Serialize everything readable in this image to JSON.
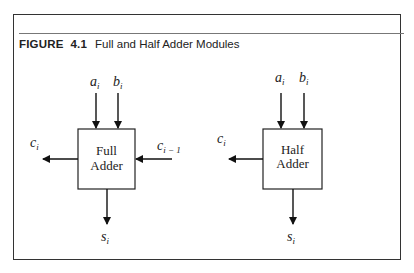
{
  "figure": {
    "label": "FIGURE",
    "number": "4.1",
    "caption": "Full and Half Adder Modules"
  },
  "full_adder": {
    "line1": "Full",
    "line2": "Adder",
    "inputs": {
      "a": "a",
      "a_sub": "i",
      "b": "b",
      "b_sub": "i",
      "cin": "c",
      "cin_sub": "i − 1"
    },
    "outputs": {
      "cout": "c",
      "cout_sub": "i",
      "s": "s",
      "s_sub": "i"
    }
  },
  "half_adder": {
    "line1": "Half",
    "line2": "Adder",
    "inputs": {
      "a": "a",
      "a_sub": "i",
      "b": "b",
      "b_sub": "i"
    },
    "outputs": {
      "cout": "c",
      "cout_sub": "i",
      "s": "s",
      "s_sub": "i"
    }
  }
}
